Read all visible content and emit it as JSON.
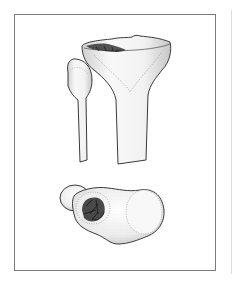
{
  "figure": {
    "views": [
      {
        "name": "anterior-view",
        "structures": [
          "tibia",
          "fibula",
          "tibial-plateau-lesion"
        ]
      },
      {
        "name": "superior-articular-view",
        "structures": [
          "tibial-plateau",
          "fibular-head",
          "cartilage-lesion"
        ]
      }
    ],
    "colors": {
      "frame": "#7a7a7a",
      "bone_fill": "#f2f2f2",
      "bone_outline": "#3a3a3a",
      "stipple": "#8a8a8a",
      "lesion": "#2a2a2a"
    }
  }
}
